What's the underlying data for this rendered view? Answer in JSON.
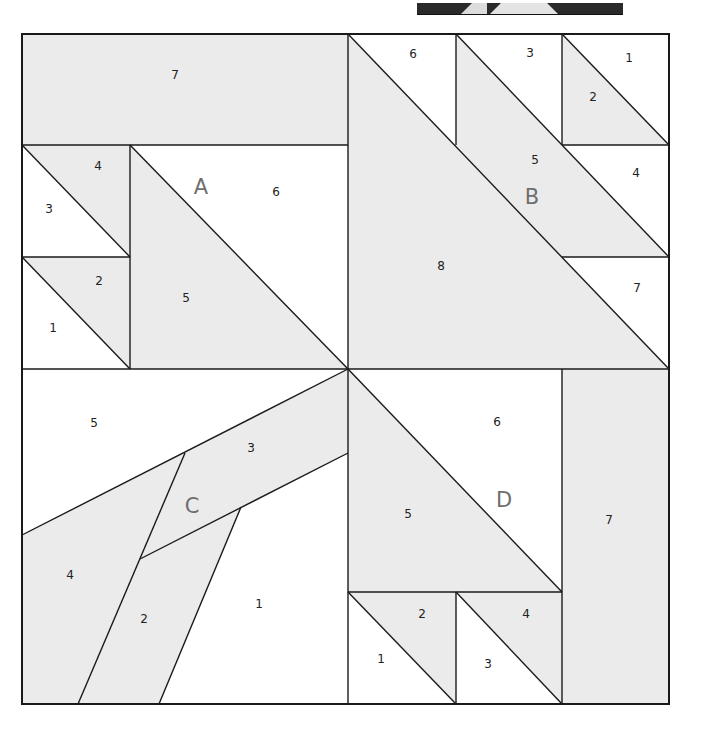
{
  "colors": {
    "shaded": "#ebebeb",
    "white": "#ffffff",
    "line": "#1a1a1a",
    "section_label": "#6e6e6e",
    "piece_label": "#222222",
    "thumb_dark": "#2a2a2a",
    "thumb_light": "#dcdcdc"
  },
  "sections": [
    {
      "id": "A",
      "label": "A",
      "pieces": [
        {
          "num": "1",
          "shade": "white"
        },
        {
          "num": "2",
          "shade": "shaded"
        },
        {
          "num": "3",
          "shade": "white"
        },
        {
          "num": "4",
          "shade": "shaded"
        },
        {
          "num": "5",
          "shade": "shaded"
        },
        {
          "num": "6",
          "shade": "white"
        },
        {
          "num": "7",
          "shade": "shaded"
        }
      ]
    },
    {
      "id": "B",
      "label": "B",
      "pieces": [
        {
          "num": "1",
          "shade": "white"
        },
        {
          "num": "2",
          "shade": "shaded"
        },
        {
          "num": "3",
          "shade": "white"
        },
        {
          "num": "4",
          "shade": "white"
        },
        {
          "num": "5",
          "shade": "shaded"
        },
        {
          "num": "6",
          "shade": "white"
        },
        {
          "num": "7",
          "shade": "white"
        },
        {
          "num": "8",
          "shade": "shaded"
        }
      ]
    },
    {
      "id": "C",
      "label": "C",
      "pieces": [
        {
          "num": "1",
          "shade": "white"
        },
        {
          "num": "2",
          "shade": "shaded"
        },
        {
          "num": "3",
          "shade": "shaded"
        },
        {
          "num": "4",
          "shade": "shaded"
        },
        {
          "num": "5",
          "shade": "white"
        }
      ]
    },
    {
      "id": "D",
      "label": "D",
      "pieces": [
        {
          "num": "1",
          "shade": "white"
        },
        {
          "num": "2",
          "shade": "shaded"
        },
        {
          "num": "3",
          "shade": "white"
        },
        {
          "num": "4",
          "shade": "shaded"
        },
        {
          "num": "5",
          "shade": "shaded"
        },
        {
          "num": "6",
          "shade": "white"
        },
        {
          "num": "7",
          "shade": "shaded"
        }
      ]
    }
  ]
}
